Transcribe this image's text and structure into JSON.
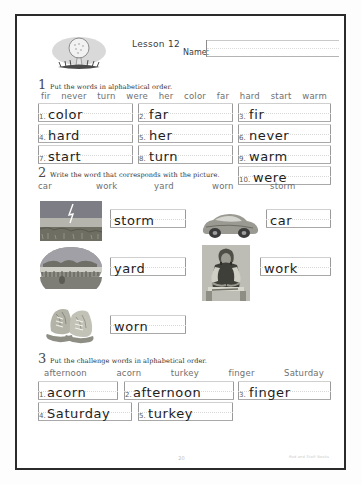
{
  "page": {
    "lesson_title": "Lesson 12",
    "name_label": "Name:",
    "page_number": "20",
    "credit": "Rod and Staff Books",
    "logo_icon": "golf-ball-on-tee-icon"
  },
  "sections": [
    {
      "number": "1",
      "instruction": "Put the words in alphabetical order.",
      "word_bank": [
        "fir",
        "never",
        "turn",
        "were",
        "her",
        "color",
        "far",
        "hard",
        "start",
        "warm"
      ],
      "answers": [
        {
          "num": "1.",
          "word": "color"
        },
        {
          "num": "2.",
          "word": "far"
        },
        {
          "num": "3.",
          "word": "fir"
        },
        {
          "num": "4.",
          "word": "hard"
        },
        {
          "num": "5.",
          "word": "her"
        },
        {
          "num": "6.",
          "word": "never"
        },
        {
          "num": "7.",
          "word": "start"
        },
        {
          "num": "8.",
          "word": "turn"
        },
        {
          "num": "9.",
          "word": "warm"
        },
        {
          "num": "10.",
          "word": "were"
        }
      ]
    },
    {
      "number": "2",
      "instruction": "Write the word that corresponds with the picture.",
      "word_bank": [
        "car",
        "work",
        "yard",
        "worn",
        "storm"
      ],
      "items": [
        {
          "picture": "lightning-storm-photo",
          "word": "storm"
        },
        {
          "picture": "sports-car-photo",
          "word": "car"
        },
        {
          "picture": "lawn-yard-photo",
          "word": "yard"
        },
        {
          "picture": "person-working-photo",
          "word": "work"
        },
        {
          "picture": "worn-shoes-photo",
          "word": "worn"
        }
      ]
    },
    {
      "number": "3",
      "instruction": "Put the challenge words in alphabetical order.",
      "word_bank": [
        "afternoon",
        "acorn",
        "turkey",
        "finger",
        "Saturday"
      ],
      "answers": [
        {
          "num": "1.",
          "word": "acorn"
        },
        {
          "num": "2.",
          "word": "afternoon"
        },
        {
          "num": "3.",
          "word": "finger"
        },
        {
          "num": "4.",
          "word": "Saturday"
        },
        {
          "num": "5.",
          "word": "turkey"
        }
      ]
    }
  ]
}
